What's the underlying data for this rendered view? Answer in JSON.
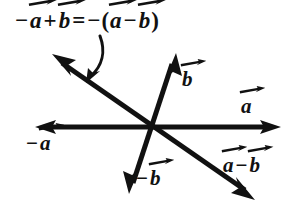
{
  "figure": {
    "background_color": "#ffffff",
    "ink_color": "#111111",
    "width": 294,
    "height": 215
  },
  "equation": {
    "full_text": "-a + b = -(a - b)",
    "terms": {
      "minus_sign_1": "−",
      "var_a_1": "a",
      "plus_sign": "+",
      "var_b_1": "b",
      "equals_sign": "=",
      "minus_sign_2": "−",
      "open_paren": "(",
      "var_a_2": "a",
      "minus_sign_3": "−",
      "var_b_2": "b",
      "close_paren": ")"
    }
  },
  "labels": {
    "b": {
      "text": "b",
      "prefix": ""
    },
    "a": {
      "text": "a",
      "prefix": ""
    },
    "neg_a": {
      "text": "a",
      "prefix": "−"
    },
    "neg_b": {
      "text": "b",
      "prefix": "−"
    },
    "a_minus_b": {
      "first": "a",
      "operator": "−",
      "second": "b"
    }
  },
  "geometry": {
    "origin_x": 148,
    "origin_y": 127,
    "vectors": [
      {
        "name": "a",
        "tip_x": 278,
        "tip_y": 127,
        "label": "a"
      },
      {
        "name": "neg-a",
        "tip_x": 38,
        "tip_y": 127,
        "label": "−a"
      },
      {
        "name": "b",
        "tip_x": 176,
        "tip_y": 57,
        "label": "b"
      },
      {
        "name": "neg-b",
        "tip_x": 130,
        "tip_y": 190,
        "label": "−b"
      },
      {
        "name": "neg-a-plus-b",
        "tip_x": 55,
        "tip_y": 57,
        "label": "−a + b"
      },
      {
        "name": "a-minus-b",
        "tip_x": 251,
        "tip_y": 196,
        "label": "a − b"
      }
    ],
    "pointer_arrow": {
      "name": "equation-pointer",
      "from_x": 99,
      "from_y": 40,
      "to_x": 88,
      "to_y": 80
    }
  }
}
